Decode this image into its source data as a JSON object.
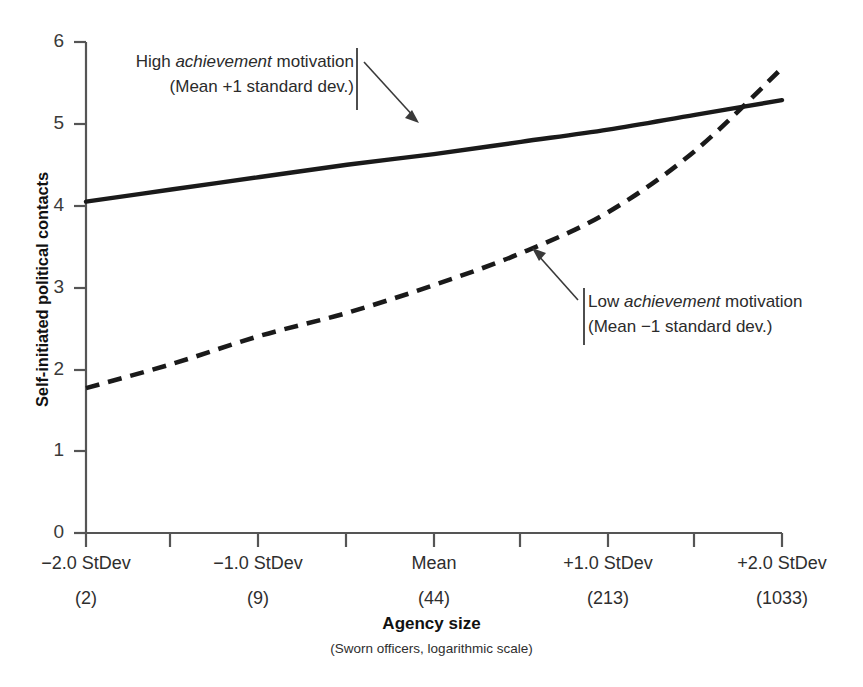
{
  "chart_data": {
    "type": "line",
    "title": "",
    "xlabel": "Agency size",
    "xlabel_sub": "(Sworn officers, logarithmic scale)",
    "ylabel": "Self-initiated political contacts",
    "ylim": [
      0,
      6
    ],
    "y_ticks": [
      6,
      5,
      4,
      3,
      2,
      1,
      0
    ],
    "grid": false,
    "legend_position": "inline-annotations",
    "x_categories": [
      "−2.0 StDev",
      "−1.0 StDev",
      "Mean",
      "+1.0 StDev",
      "+2.0 StDev"
    ],
    "x_categories_sub": [
      "(2)",
      "(9)",
      "(44)",
      "(213)",
      "(1033)"
    ],
    "x_values": [
      -2.0,
      -1.0,
      0.0,
      1.0,
      2.0
    ],
    "series": [
      {
        "name": "High achievement motivation (Mean +1 standard dev.)",
        "style": "solid",
        "color": "#1a1a1a",
        "x": [
          -2.0,
          -1.5,
          -1.0,
          -0.5,
          0.0,
          0.5,
          1.0,
          1.5,
          2.0
        ],
        "values": [
          4.05,
          4.2,
          4.35,
          4.5,
          4.63,
          4.78,
          4.93,
          5.11,
          5.29
        ]
      },
      {
        "name": "Low achievement motivation (Mean −1 standard dev.)",
        "style": "dashed",
        "color": "#1a1a1a",
        "x": [
          -2.0,
          -1.5,
          -1.0,
          -0.5,
          0.0,
          0.5,
          1.0,
          1.5,
          2.0
        ],
        "values": [
          1.77,
          2.07,
          2.41,
          2.69,
          3.03,
          3.42,
          3.92,
          4.67,
          5.68
        ]
      }
    ],
    "annotations": [
      {
        "id": "high-achievement",
        "line1_pre": "High ",
        "line1_em": "achievement",
        "line1_post": " motivation",
        "line2": "(Mean +1 standard dev.)",
        "arrow_from": [
          370,
          112
        ],
        "arrow_to": [
          427,
          150
        ]
      },
      {
        "id": "low-achievement",
        "line1_pre": "Low ",
        "line1_em": "achievement",
        "line1_post": " motivation",
        "line2": "(Mean −1 standard dev.)",
        "arrow_from": [
          572,
          321
        ],
        "arrow_to": [
          536,
          249
        ]
      }
    ],
    "axis_color": "#555555",
    "line_color": "#1a1a1a"
  },
  "axes": {
    "y_ticks": [
      {
        "label": "6",
        "value": 6
      },
      {
        "label": "5",
        "value": 5
      },
      {
        "label": "4",
        "value": 4
      },
      {
        "label": "3",
        "value": 3
      },
      {
        "label": "2",
        "value": 2
      },
      {
        "label": "1",
        "value": 1
      },
      {
        "label": "0",
        "value": 0
      }
    ],
    "x_ticks": [
      {
        "primary": "−2.0 StDev",
        "secondary": "(2)",
        "x": 86
      },
      {
        "primary": "−1.0 StDev",
        "secondary": "(9)",
        "x": 258
      },
      {
        "primary": "Mean",
        "secondary": "(44)",
        "x": 434
      },
      {
        "primary": "+1.0 StDev",
        "secondary": "(213)",
        "x": 608
      },
      {
        "primary": "+2.0 StDev",
        "secondary": "(1033)",
        "x": 782
      }
    ]
  },
  "labels": {
    "y_axis_title": "Self-initiated political contacts",
    "x_axis_title": "Agency size",
    "x_axis_subtitle": "(Sworn officers, logarithmic scale)"
  },
  "annotations": {
    "high": {
      "line1_pre": "High ",
      "line1_em": "achievement",
      "line1_post": " motivation",
      "line2": "(Mean +1 standard dev.)"
    },
    "low": {
      "line1_pre": "Low ",
      "line1_em": "achievement",
      "line1_post": " motivation",
      "line2": "(Mean −1 standard dev.)"
    }
  }
}
